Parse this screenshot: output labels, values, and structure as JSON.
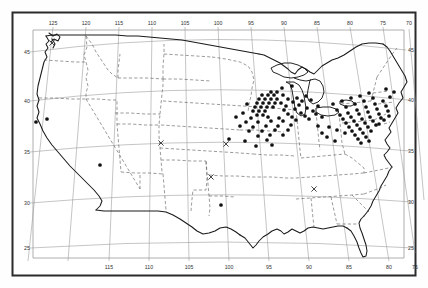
{
  "figure": {
    "name": "us-distribution-map",
    "type": "point-distribution-map",
    "region": "Contiguous United States",
    "projection": "conic",
    "background_color": "#fefefe",
    "frame_color": "#2b2b2b",
    "coast_color": "#1a1a1a",
    "state_border_color": "#555555",
    "graticule_color": "#8c8c8c",
    "point_color": "#111111",
    "cross_color": "#333333"
  },
  "axes": {
    "top": {
      "name": "longitude-axis-top",
      "label_type": "longitude-west",
      "labels": [
        "125",
        "120",
        "115",
        "110",
        "105",
        "100",
        "95",
        "90",
        "85",
        "80",
        "75",
        "70"
      ],
      "values": [
        125,
        120,
        115,
        110,
        105,
        100,
        95,
        90,
        85,
        80,
        75,
        70
      ]
    },
    "bottom": {
      "name": "longitude-axis-bottom",
      "label_type": "longitude-west",
      "labels": [
        "115",
        "110",
        "105",
        "100",
        "95",
        "90",
        "85",
        "80",
        "75"
      ],
      "values": [
        115,
        110,
        105,
        100,
        95,
        90,
        85,
        80,
        75
      ]
    },
    "left": {
      "name": "latitude-axis-left",
      "label_type": "latitude-north",
      "labels": [
        "45",
        "40",
        "35",
        "30",
        "25"
      ],
      "values": [
        45,
        40,
        35,
        30,
        25
      ]
    },
    "right": {
      "name": "latitude-axis-right",
      "label_type": "latitude-north",
      "labels": [
        "45",
        "40",
        "35",
        "30",
        "25"
      ],
      "values": [
        45,
        40,
        35,
        30,
        25
      ]
    }
  },
  "chart_data": {
    "type": "scatter",
    "title": "",
    "xlabel": "",
    "ylabel": "",
    "xlim": [
      128,
      66
    ],
    "ylim": [
      23,
      50
    ],
    "grid": true,
    "legend": "none",
    "markers": {
      "filled_circle": {
        "count": 131,
        "label": "occurrence record"
      },
      "cross": {
        "count": 4,
        "label": "secondary record"
      }
    },
    "points": [
      [
        36,
        122
      ],
      [
        47,
        119
      ],
      [
        100,
        165
      ],
      [
        292,
        86
      ],
      [
        282,
        88
      ],
      [
        271,
        92
      ],
      [
        277,
        92
      ],
      [
        262,
        95
      ],
      [
        268,
        95
      ],
      [
        274,
        95
      ],
      [
        283,
        95
      ],
      [
        259,
        99
      ],
      [
        265,
        99
      ],
      [
        271,
        99
      ],
      [
        277,
        99
      ],
      [
        288,
        99
      ],
      [
        297,
        98
      ],
      [
        306,
        96
      ],
      [
        257,
        103
      ],
      [
        263,
        103
      ],
      [
        269,
        103
      ],
      [
        275,
        103
      ],
      [
        281,
        103
      ],
      [
        293,
        102
      ],
      [
        302,
        101
      ],
      [
        311,
        100
      ],
      [
        247,
        104
      ],
      [
        255,
        107
      ],
      [
        261,
        107
      ],
      [
        267,
        107
      ],
      [
        273,
        107
      ],
      [
        286,
        106
      ],
      [
        299,
        105
      ],
      [
        253,
        111
      ],
      [
        259,
        111
      ],
      [
        265,
        111
      ],
      [
        284,
        110
      ],
      [
        295,
        109
      ],
      [
        307,
        108
      ],
      [
        318,
        106
      ],
      [
        243,
        113
      ],
      [
        257,
        115
      ],
      [
        263,
        115
      ],
      [
        288,
        114
      ],
      [
        301,
        113
      ],
      [
        313,
        111
      ],
      [
        236,
        117
      ],
      [
        251,
        118
      ],
      [
        268,
        117
      ],
      [
        279,
        118
      ],
      [
        292,
        117
      ],
      [
        305,
        116
      ],
      [
        316,
        114
      ],
      [
        246,
        122
      ],
      [
        258,
        122
      ],
      [
        271,
        121
      ],
      [
        283,
        121
      ],
      [
        296,
        120
      ],
      [
        309,
        119
      ],
      [
        322,
        117
      ],
      [
        240,
        126
      ],
      [
        253,
        127
      ],
      [
        266,
        126
      ],
      [
        278,
        126
      ],
      [
        291,
        125
      ],
      [
        249,
        131
      ],
      [
        262,
        131
      ],
      [
        275,
        130
      ],
      [
        288,
        130
      ],
      [
        258,
        136
      ],
      [
        270,
        135
      ],
      [
        283,
        135
      ],
      [
        229,
        139
      ],
      [
        245,
        141
      ],
      [
        267,
        140
      ],
      [
        256,
        146
      ],
      [
        272,
        145
      ],
      [
        221,
        205
      ],
      [
        333,
        104
      ],
      [
        342,
        101
      ],
      [
        351,
        98
      ],
      [
        360,
        96
      ],
      [
        369,
        93
      ],
      [
        337,
        110
      ],
      [
        346,
        107
      ],
      [
        355,
        104
      ],
      [
        364,
        101
      ],
      [
        373,
        98
      ],
      [
        340,
        115
      ],
      [
        348,
        113
      ],
      [
        357,
        110
      ],
      [
        366,
        107
      ],
      [
        375,
        104
      ],
      [
        383,
        101
      ],
      [
        343,
        119
      ],
      [
        351,
        117
      ],
      [
        359,
        114
      ],
      [
        368,
        112
      ],
      [
        377,
        109
      ],
      [
        386,
        106
      ],
      [
        346,
        123
      ],
      [
        354,
        121
      ],
      [
        362,
        119
      ],
      [
        370,
        117
      ],
      [
        379,
        114
      ],
      [
        388,
        111
      ],
      [
        349,
        127
      ],
      [
        357,
        125
      ],
      [
        365,
        123
      ],
      [
        373,
        121
      ],
      [
        381,
        118
      ],
      [
        352,
        131
      ],
      [
        360,
        129
      ],
      [
        368,
        127
      ],
      [
        376,
        125
      ],
      [
        355,
        135
      ],
      [
        363,
        133
      ],
      [
        371,
        131
      ],
      [
        358,
        139
      ],
      [
        366,
        137
      ],
      [
        361,
        143
      ],
      [
        369,
        141
      ],
      [
        345,
        133
      ],
      [
        337,
        130
      ],
      [
        329,
        127
      ],
      [
        327,
        137
      ],
      [
        335,
        141
      ],
      [
        318,
        126
      ],
      [
        322,
        133
      ],
      [
        390,
        97
      ],
      [
        394,
        92
      ],
      [
        386,
        89
      ],
      [
        379,
        124
      ],
      [
        384,
        120
      ],
      [
        389,
        116
      ]
    ],
    "crosses": [
      [
        161,
        143
      ],
      [
        226,
        144
      ],
      [
        211,
        177
      ],
      [
        314,
        189
      ],
      [
        52,
        43
      ]
    ]
  }
}
